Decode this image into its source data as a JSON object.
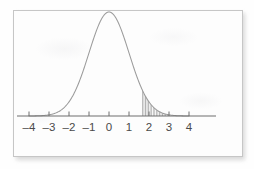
{
  "figure": {
    "caption": "",
    "card_background": "#fdfdfd",
    "border_color": "#c6c6c6",
    "curve_color": "#9a9a9a",
    "axis_color": "#6e6e6e",
    "label_color": "#4a4a4a",
    "hatch_color": "#9e9e9e"
  },
  "axis": {
    "tick_labels": [
      "–4",
      "–3",
      "–2",
      "–1",
      "0",
      "1",
      "2",
      "3",
      "4"
    ],
    "tick_values": [
      -4,
      -3,
      -2,
      -1,
      0,
      1,
      2,
      3,
      4
    ]
  },
  "chart_data": {
    "type": "line",
    "title": "",
    "subtitle": "",
    "xlabel": "",
    "ylabel": "",
    "xlim": [
      -4,
      4
    ],
    "ylim": [
      0,
      0.42
    ],
    "grid": false,
    "legend": null,
    "distribution": "standard normal",
    "mean": 0,
    "sd": 1,
    "x": [
      -4,
      -3.75,
      -3.5,
      -3.25,
      -3,
      -2.75,
      -2.5,
      -2.25,
      -2,
      -1.75,
      -1.5,
      -1.25,
      -1,
      -0.75,
      -0.5,
      -0.25,
      0,
      0.25,
      0.5,
      0.75,
      1,
      1.25,
      1.5,
      1.75,
      2,
      2.25,
      2.5,
      2.75,
      3,
      3.25,
      3.5,
      3.75,
      4
    ],
    "values": [
      0.0001,
      0.0004,
      0.0009,
      0.002,
      0.0044,
      0.0091,
      0.0175,
      0.0317,
      0.054,
      0.0863,
      0.1295,
      0.1826,
      0.242,
      0.3011,
      0.3521,
      0.3867,
      0.3989,
      0.3867,
      0.3521,
      0.3011,
      0.242,
      0.1826,
      0.1295,
      0.0863,
      0.054,
      0.0317,
      0.0175,
      0.0091,
      0.0044,
      0.002,
      0.0009,
      0.0004,
      0.0001
    ],
    "shaded_region": {
      "style": "vertical-hatch",
      "from": 1.65,
      "to": 3.0,
      "tail": "right",
      "approx_area": 0.05
    },
    "annotations": []
  }
}
